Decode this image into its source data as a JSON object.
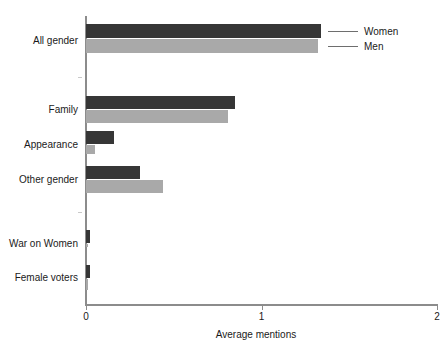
{
  "chart_data": {
    "type": "bar",
    "orientation": "horizontal",
    "title": "",
    "xlabel": "Average mentions",
    "ylabel": "",
    "xlim": [
      0,
      2
    ],
    "xticks": [
      0,
      1,
      2
    ],
    "xtick_labels": [
      "0",
      "1",
      "2"
    ],
    "grid": false,
    "legend_position": "leader-lines-right-of-top-bars",
    "categories": [
      "All gender",
      "",
      "Family",
      "Appearance",
      "Other gender",
      "",
      "War on Women",
      "Female voters"
    ],
    "series": [
      {
        "name": "Women",
        "color": "#363636",
        "values": [
          1.34,
          null,
          0.85,
          0.16,
          0.31,
          null,
          0.025,
          0.025
        ]
      },
      {
        "name": "Men",
        "color": "#a9a9a9",
        "values": [
          1.32,
          null,
          0.81,
          0.05,
          0.44,
          null,
          0.0,
          0.012
        ]
      }
    ]
  },
  "legend": {
    "entries": [
      {
        "label": "Women",
        "color": "#363636"
      },
      {
        "label": "Men",
        "color": "#a9a9a9"
      }
    ]
  },
  "axis": {
    "x_title": "Average mentions",
    "tick_0": "0",
    "tick_1": "1",
    "tick_2": "2"
  },
  "categories": {
    "all_gender": "All gender",
    "family": "Family",
    "appearance": "Appearance",
    "other_gender": "Other gender",
    "war_on_women": "War on Women",
    "female_voters": "Female voters"
  }
}
